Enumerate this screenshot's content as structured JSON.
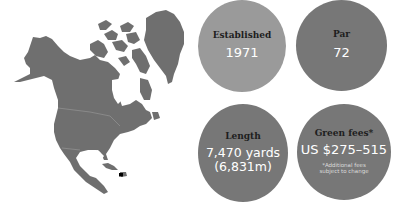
{
  "map": {
    "region": "North America",
    "land_color": "#6f6f6f",
    "marker": {
      "label": "course-location-marker",
      "x": 121,
      "y": 175,
      "color": "#000000"
    }
  },
  "stats": [
    {
      "label": "Established",
      "value": "1971",
      "color": "#9a9a9a"
    },
    {
      "label": "Par",
      "value": "72",
      "color": "#777777"
    },
    {
      "label": "Length",
      "value": "7,470 yards",
      "value2": "(6,831m)",
      "color": "#777777"
    },
    {
      "label": "Green fees*",
      "value": "US $275–515",
      "note1": "*Additional fees",
      "note2": "subject to change",
      "color": "#777777"
    }
  ]
}
